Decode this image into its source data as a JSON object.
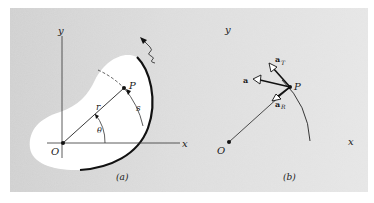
{
  "figure": {
    "background": "#d9d9d9",
    "line_color": "#1a1a1a",
    "panel_a": {
      "caption": "(a)",
      "axis_x_label": "x",
      "axis_y_label": "y",
      "origin_label": "O",
      "point_label": "P",
      "radius_label": "r",
      "arc_label": "s",
      "angle_label": "θ"
    },
    "panel_b": {
      "caption": "(b)",
      "axis_x_label": "x",
      "axis_y_label": "y",
      "origin_label": "O",
      "point_label": "P",
      "vector_total_label": "a",
      "vector_tangential_label": "a",
      "vector_tangential_subscript": "T",
      "vector_radial_label": "a",
      "vector_radial_subscript": "R"
    }
  }
}
